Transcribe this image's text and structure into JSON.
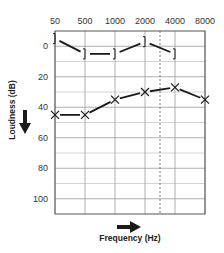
{
  "chart_data": {
    "type": "line",
    "title": "",
    "xlabel": "Frequency (Hz)",
    "ylabel": "Loudness (dB)",
    "categories": [
      "50",
      "500",
      "1000",
      "2000",
      "4000",
      "8000"
    ],
    "ylim": [
      -10,
      110
    ],
    "y_ticks": [
      0,
      20,
      40,
      60,
      80,
      100
    ],
    "y_inverted": true,
    "grid": true,
    "dashed_vertical_line_between": [
      "2000",
      "4000"
    ],
    "series": [
      {
        "name": "bracket-marker",
        "marker": "]",
        "values": [
          -5,
          5,
          5,
          -3,
          5,
          null
        ]
      },
      {
        "name": "x-marker",
        "marker": "X",
        "values": [
          45,
          45,
          35,
          30,
          27,
          35
        ]
      }
    ]
  },
  "colors": {
    "line": "#1a1a1a",
    "grid": "#9a9a9a",
    "grid_minor": "#c8c8c8"
  }
}
